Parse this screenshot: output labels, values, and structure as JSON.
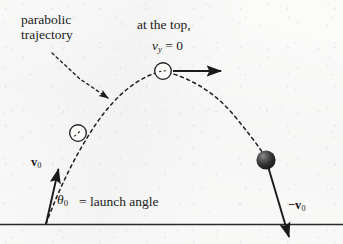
{
  "figure": {
    "background_color": "#fbfbfa",
    "ink_color": "#1a1a1a"
  },
  "labels": {
    "parabolic_line1": "parabolic",
    "parabolic_line2": "trajectory",
    "at_the_top": "at the top,",
    "vy_symbol": "v",
    "vy_subscript": "y",
    "vy_value": "= 0",
    "v0_symbol": "v",
    "v0_subscript": "0",
    "theta_symbol": "θ",
    "theta_subscript": "0",
    "launch_angle": "= launch angle",
    "neg_v0_symbol": "−v",
    "neg_v0_subscript": "0"
  },
  "elements": {
    "ground_line": "ground-line",
    "trajectory": "dashed-parabolic-trajectory",
    "leader_arrow": "dashed-leader-arrow",
    "apex_marker": "open-circle-marker-apex",
    "ascent_marker": "open-circle-marker-ascent",
    "projectile": "shaded-ball",
    "apex_velocity_arrow": "horizontal-velocity-arrow",
    "launch_velocity_arrow": "initial-velocity-arrow",
    "landing_velocity_arrow": "final-velocity-arrow"
  },
  "geometry": {
    "launch_point": [
      46,
      224
    ],
    "apex_point": [
      163,
      71
    ],
    "landing_ball": [
      266,
      160
    ],
    "ground_y": 224,
    "apex_arrow_end_x": 222,
    "ascent_marker": [
      78,
      133
    ]
  },
  "colors": {
    "ink": "#1a1a1a",
    "ball_dark": "#2b2b2b",
    "ball_highlight": "#9a9a9a",
    "ground": "#2a2a2a"
  }
}
